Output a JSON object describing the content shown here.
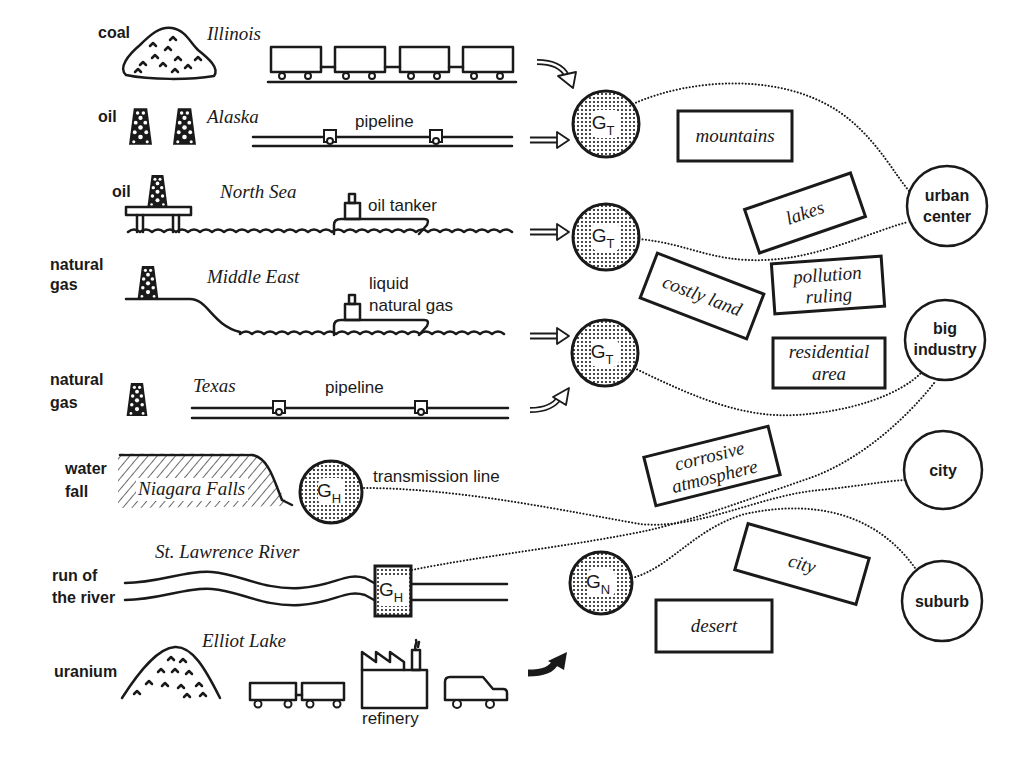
{
  "colors": {
    "ink": "#1a1a1a",
    "paper": "#ffffff"
  },
  "sources": {
    "coal": {
      "resource": "coal",
      "location": "Illinois"
    },
    "oil_alaska": {
      "resource": "oil",
      "location": "Alaska",
      "transport": "pipeline"
    },
    "oil_north_sea": {
      "resource": "oil",
      "location": "North Sea",
      "transport": "oil tanker"
    },
    "gas_middle_east": {
      "resource": [
        "natural",
        "gas"
      ],
      "location": "Middle East",
      "transport": [
        "liquid",
        "natural gas"
      ]
    },
    "gas_texas": {
      "resource": [
        "natural",
        "gas"
      ],
      "location": "Texas",
      "transport": "pipeline"
    },
    "waterfall": {
      "resource": [
        "water",
        "fall"
      ],
      "location": "Niagara Falls",
      "transport": "transmission line"
    },
    "river": {
      "resource": [
        "run of",
        "the river"
      ],
      "location": "St. Lawrence River"
    },
    "uranium": {
      "resource": "uranium",
      "location": "Elliot Lake",
      "facility": "refinery"
    }
  },
  "generators": {
    "thermal_1": {
      "symbol": "G",
      "subscript": "T"
    },
    "thermal_2": {
      "symbol": "G",
      "subscript": "T"
    },
    "thermal_3": {
      "symbol": "G",
      "subscript": "T"
    },
    "hydro_falls": {
      "symbol": "G",
      "subscript": "H"
    },
    "hydro_river": {
      "symbol": "G",
      "subscript": "H"
    },
    "nuclear": {
      "symbol": "G",
      "subscript": "N"
    }
  },
  "siting_constraints": {
    "mountains": [
      "mountains"
    ],
    "lakes": [
      "lakes"
    ],
    "costly_land": [
      "costly land"
    ],
    "pollution_ruling": [
      "pollution",
      "ruling"
    ],
    "residential_area": [
      "residential",
      "area"
    ],
    "corrosive_atmosphere": [
      "corrosive",
      "atmosphere"
    ],
    "city": [
      "city"
    ],
    "desert": [
      "desert"
    ]
  },
  "loads": {
    "urban_center": [
      "urban",
      "center"
    ],
    "big_industry": [
      "big",
      "industry"
    ],
    "city": [
      "city"
    ],
    "suburb": [
      "suburb"
    ]
  }
}
